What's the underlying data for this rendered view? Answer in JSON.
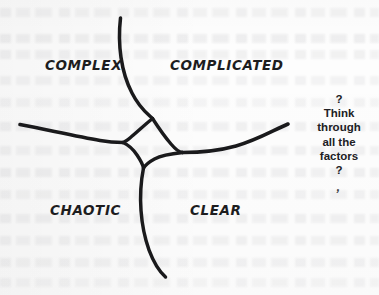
{
  "diagram": {
    "type": "hand-drawn quadrant diagram",
    "background_color": "#fdfdfd",
    "ink_color": "#1a1a1c",
    "quadrants": [
      {
        "id": "complex",
        "label": "COMPLEX",
        "position": "top-left"
      },
      {
        "id": "complicated",
        "label": "COMPLICATED",
        "position": "top-right"
      },
      {
        "id": "chaotic",
        "label": "CHAOTIC",
        "position": "bottom-left"
      },
      {
        "id": "clear",
        "label": "CLEAR",
        "position": "bottom-right"
      }
    ],
    "center": {
      "shape": "four-pointed concave star",
      "description": "four curved strokes meeting at an astroid-shaped void"
    },
    "strokes": [
      {
        "id": "top-stroke",
        "from": [
          120,
          18
        ],
        "to": [
          152,
          118
        ]
      },
      {
        "id": "left-stroke",
        "from": [
          20,
          124
        ],
        "to": [
          122,
          142
        ]
      },
      {
        "id": "right-stroke",
        "from": [
          288,
          124
        ],
        "to": [
          183,
          152
        ]
      },
      {
        "id": "bottom-stroke",
        "from": [
          143,
          168
        ],
        "to": [
          165,
          277
        ]
      }
    ]
  },
  "margin_note": {
    "lines": [
      "?",
      "Think",
      "through",
      "all the",
      "factors",
      "?"
    ],
    "tick_mark": "‚"
  }
}
